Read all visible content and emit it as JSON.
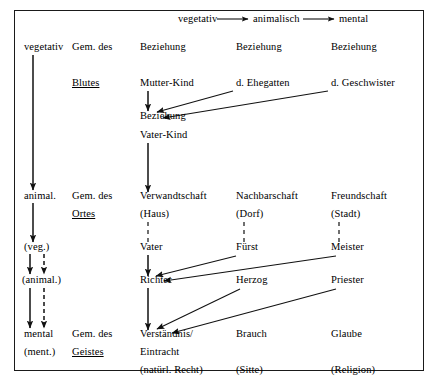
{
  "diagram": {
    "title_row": {
      "items": [
        {
          "text": "vegetativ",
          "x": 178,
          "y": 22
        },
        {
          "text": "animalisch",
          "x": 253,
          "y": 22
        },
        {
          "text": "mental",
          "x": 339,
          "y": 22
        }
      ]
    },
    "labels": [
      {
        "id": "c0-vegetativ",
        "text": "vegetativ",
        "x": 24,
        "y": 50,
        "underline": false
      },
      {
        "id": "c1-gem-des-1",
        "text": "Gem. des",
        "x": 72,
        "y": 50,
        "underline": false
      },
      {
        "id": "c2-beziehung-1",
        "text": "Beziehung",
        "x": 140,
        "y": 50,
        "underline": false
      },
      {
        "id": "c3-beziehung-1",
        "text": "Beziehung",
        "x": 236,
        "y": 50,
        "underline": false
      },
      {
        "id": "c4-beziehung-1",
        "text": "Beziehung",
        "x": 331,
        "y": 50,
        "underline": false
      },
      {
        "id": "c1-blutes",
        "text": "Blutes",
        "x": 72,
        "y": 86,
        "underline": true
      },
      {
        "id": "c2-mutter-kind",
        "text": "Mutter-Kind",
        "x": 140,
        "y": 86,
        "underline": false
      },
      {
        "id": "c3-ehegatten",
        "text": "d. Ehegatten",
        "x": 236,
        "y": 86,
        "underline": false
      },
      {
        "id": "c4-geschwister",
        "text": "d. Geschwister",
        "x": 331,
        "y": 86,
        "underline": false
      },
      {
        "id": "c2-beziehung-2",
        "text": "Beziehung",
        "x": 140,
        "y": 119,
        "underline": false
      },
      {
        "id": "c2-vater-kind",
        "text": "Vater-Kind",
        "x": 140,
        "y": 138,
        "underline": false
      },
      {
        "id": "c0-animal",
        "text": "animal.",
        "x": 24,
        "y": 199,
        "underline": false
      },
      {
        "id": "c1-gem-des-2",
        "text": "Gem. des",
        "x": 72,
        "y": 199,
        "underline": false
      },
      {
        "id": "c2-verwandtschaft",
        "text": "Verwandtschaft",
        "x": 140,
        "y": 199,
        "underline": false
      },
      {
        "id": "c3-nachbarschaft",
        "text": "Nachbarschaft",
        "x": 236,
        "y": 199,
        "underline": false
      },
      {
        "id": "c4-freundschaft",
        "text": "Freundschaft",
        "x": 331,
        "y": 199,
        "underline": false
      },
      {
        "id": "c1-ortes",
        "text": "Ortes",
        "x": 72,
        "y": 217,
        "underline": true
      },
      {
        "id": "c2-haus",
        "text": "(Haus)",
        "x": 140,
        "y": 217,
        "underline": false
      },
      {
        "id": "c3-dorf",
        "text": "(Dorf)",
        "x": 236,
        "y": 217,
        "underline": false
      },
      {
        "id": "c4-stadt",
        "text": "(Stadt)",
        "x": 331,
        "y": 217,
        "underline": false
      },
      {
        "id": "c0-veg",
        "text": "(veg.)",
        "x": 24,
        "y": 250,
        "underline": false
      },
      {
        "id": "c2-vater",
        "text": "Vater",
        "x": 140,
        "y": 250,
        "underline": false
      },
      {
        "id": "c3-fuerst",
        "text": "Fürst",
        "x": 236,
        "y": 250,
        "underline": false
      },
      {
        "id": "c4-meister",
        "text": "Meister",
        "x": 331,
        "y": 250,
        "underline": false
      },
      {
        "id": "c0-animal-paren",
        "text": "(animal.)",
        "x": 22,
        "y": 283,
        "underline": false
      },
      {
        "id": "c2-richter",
        "text": "Richter",
        "x": 140,
        "y": 283,
        "underline": false
      },
      {
        "id": "c3-herzog",
        "text": "Herzog",
        "x": 236,
        "y": 283,
        "underline": false
      },
      {
        "id": "c4-priester",
        "text": "Priester",
        "x": 331,
        "y": 283,
        "underline": false
      },
      {
        "id": "c0-mental",
        "text": "mental",
        "x": 24,
        "y": 337,
        "underline": false
      },
      {
        "id": "c1-gem-des-3",
        "text": "Gem. des",
        "x": 72,
        "y": 337,
        "underline": false
      },
      {
        "id": "c2-verstaendnis",
        "text": "Verständnis/",
        "x": 140,
        "y": 337,
        "underline": false
      },
      {
        "id": "c3-brauch",
        "text": "Brauch",
        "x": 236,
        "y": 337,
        "underline": false
      },
      {
        "id": "c4-glaube",
        "text": "Glaube",
        "x": 331,
        "y": 337,
        "underline": false
      },
      {
        "id": "c0-ment-paren",
        "text": "(ment.)",
        "x": 24,
        "y": 355,
        "underline": false
      },
      {
        "id": "c1-geistes",
        "text": "Geistes",
        "x": 72,
        "y": 355,
        "underline": true
      },
      {
        "id": "c2-eintracht",
        "text": "Eintracht",
        "x": 140,
        "y": 355,
        "underline": false
      },
      {
        "id": "c2-natuerl-recht",
        "text": "(natürl. Recht)",
        "x": 140,
        "y": 373,
        "underline": false
      },
      {
        "id": "c3-sitte",
        "text": "(Sitte)",
        "x": 236,
        "y": 373,
        "underline": false
      },
      {
        "id": "c4-religion",
        "text": "(Religion)",
        "x": 331,
        "y": 373,
        "underline": false
      }
    ],
    "connectors": [
      {
        "id": "top-veg-to-anim",
        "kind": "arrow-solid-h",
        "x1": 217,
        "y1": 19,
        "x2": 248,
        "y2": 19
      },
      {
        "id": "top-anim-to-ment",
        "kind": "arrow-solid-h",
        "x1": 303,
        "y1": 19,
        "x2": 334,
        "y2": 19
      },
      {
        "id": "left-veg-to-animal",
        "kind": "arrow-solid-v",
        "x1": 33,
        "y1": 55,
        "x2": 33,
        "y2": 190
      },
      {
        "id": "left-animal-to-veg",
        "kind": "arrow-solid-v",
        "x1": 33,
        "y1": 203,
        "x2": 33,
        "y2": 242
      },
      {
        "id": "left-veg-to-anim2-solid",
        "kind": "arrow-solid-v",
        "x1": 30,
        "y1": 254,
        "x2": 30,
        "y2": 274
      },
      {
        "id": "left-veg-to-anim2-dash",
        "kind": "arrow-dash-v",
        "x1": 44,
        "y1": 254,
        "x2": 44,
        "y2": 274
      },
      {
        "id": "left-anim2-to-ment-solid",
        "kind": "arrow-solid-v",
        "x1": 30,
        "y1": 288,
        "x2": 30,
        "y2": 328
      },
      {
        "id": "left-anim2-to-ment-dash",
        "kind": "arrow-dash-v",
        "x1": 44,
        "y1": 288,
        "x2": 44,
        "y2": 328
      },
      {
        "id": "mutter-to-beziehung",
        "kind": "arrow-solid-v",
        "x1": 148,
        "y1": 91,
        "x2": 148,
        "y2": 111
      },
      {
        "id": "ehegatten-to-beziehung",
        "kind": "arrow-diag",
        "x1": 233,
        "y1": 91,
        "x2": 157,
        "y2": 112
      },
      {
        "id": "geschwister-to-beziehung",
        "kind": "arrow-diag",
        "x1": 328,
        "y1": 91,
        "x2": 163,
        "y2": 118
      },
      {
        "id": "beziehung-to-verwandtschaft",
        "kind": "arrow-solid-v",
        "x1": 148,
        "y1": 143,
        "x2": 148,
        "y2": 192
      },
      {
        "id": "haus-to-vater",
        "kind": "dash-plain-v",
        "x1": 148,
        "y1": 222,
        "x2": 148,
        "y2": 243
      },
      {
        "id": "dorf-to-fuerst",
        "kind": "dash-plain-v",
        "x1": 244,
        "y1": 222,
        "x2": 244,
        "y2": 243
      },
      {
        "id": "stadt-to-meister",
        "kind": "dash-plain-v",
        "x1": 339,
        "y1": 222,
        "x2": 339,
        "y2": 243
      },
      {
        "id": "vater-to-richter",
        "kind": "arrow-solid-v",
        "x1": 148,
        "y1": 255,
        "x2": 148,
        "y2": 276
      },
      {
        "id": "fuerst-to-richter",
        "kind": "arrow-diag",
        "x1": 236,
        "y1": 256,
        "x2": 156,
        "y2": 276
      },
      {
        "id": "meister-to-richter",
        "kind": "arrow-diag",
        "x1": 336,
        "y1": 256,
        "x2": 164,
        "y2": 281
      },
      {
        "id": "richter-to-verstaendnis",
        "kind": "arrow-solid-v",
        "x1": 148,
        "y1": 288,
        "x2": 148,
        "y2": 330
      },
      {
        "id": "herzog-to-verstaendnis",
        "kind": "arrow-diag",
        "x1": 240,
        "y1": 289,
        "x2": 157,
        "y2": 329
      },
      {
        "id": "priester-to-verstaendnis",
        "kind": "arrow-diag",
        "x1": 336,
        "y1": 289,
        "x2": 172,
        "y2": 333
      }
    ]
  }
}
